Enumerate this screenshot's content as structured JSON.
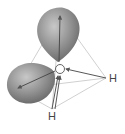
{
  "diagram": {
    "atoms": {
      "oxygen": {
        "label": "O"
      },
      "hydrogen_right": {
        "label": "H"
      },
      "hydrogen_bottom": {
        "label": "H"
      }
    },
    "lone_pairs": [
      "lone-pair-top",
      "lone-pair-left"
    ],
    "colors": {
      "lobe": "#8a8a8a",
      "line": "#b5b5b5",
      "arrow": "#555555",
      "text": "#444444"
    }
  }
}
